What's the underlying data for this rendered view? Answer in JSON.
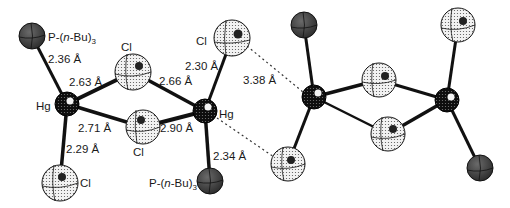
{
  "figure": {
    "colors": {
      "background": "#ffffff",
      "bond": "#111111",
      "p_atom": "#3a3a3a",
      "hg_atom": "#0e0e0e",
      "cl_atom": "#e6e6e6",
      "contact": "#333333"
    }
  },
  "labels": {
    "p_top_left": {
      "pre": "P-(",
      "italic": "n",
      "post": "-Bu)",
      "sub": "3"
    },
    "p_bottom_right": {
      "pre": "P-(",
      "italic": "n",
      "post": "-Bu)",
      "sub": "3"
    },
    "hg_left": "Hg",
    "hg_right": "Hg",
    "cl_top_bridge": "Cl",
    "cl_bottom_bridge": "Cl",
    "cl_top_terminal": "Cl",
    "cl_bottom_terminal": "Cl",
    "dist_hg_p_left": "2.36 Å",
    "dist_hg_cl_bridge_top_left": "2.63 Å",
    "dist_hg_cl_bridge_top_right": "2.66 Å",
    "dist_hg_cl_terminal_top": "2.30 Å",
    "dist_intermolecular": "3.38 Å",
    "dist_hg_cl_bridge_bottom_left": "2.71 Å",
    "dist_hg_cl_bridge_bottom_right": "2.90 Å",
    "dist_hg_cl_terminal_bottom": "2.29 Å",
    "dist_hg_p_right": "2.34 Å"
  }
}
